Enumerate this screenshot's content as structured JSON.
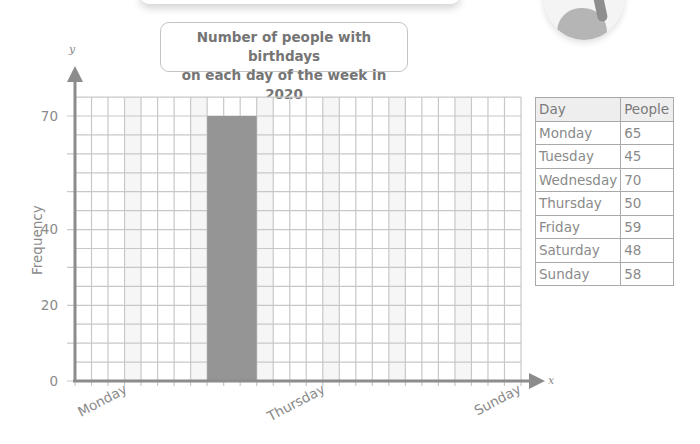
{
  "title": {
    "line1": "Number of people with birthdays",
    "line2": "on each day of the week in 2020"
  },
  "axes": {
    "y_letter": "y",
    "x_letter": "x",
    "ylabel": "Frequency",
    "y_ticks": [
      "0",
      "20",
      "40",
      "70"
    ],
    "x_labels": [
      "Monday",
      "Thursday",
      "Sunday"
    ]
  },
  "table": {
    "headers": [
      "Day",
      "People"
    ],
    "rows": [
      {
        "day": "Monday",
        "people": "65"
      },
      {
        "day": "Tuesday",
        "people": "45"
      },
      {
        "day": "Wednesday",
        "people": "70"
      },
      {
        "day": "Thursday",
        "people": "50"
      },
      {
        "day": "Friday",
        "people": "59"
      },
      {
        "day": "Saturday",
        "people": "48"
      },
      {
        "day": "Sunday",
        "people": "58"
      }
    ]
  },
  "colors": {
    "bar": "#959595",
    "grid": "#c8c8c8",
    "axis": "#8c8c8c"
  },
  "chart_data": {
    "type": "bar",
    "title": "Number of people with birthdays on each day of the week in 2020",
    "xlabel": "",
    "ylabel": "Frequency",
    "categories": [
      "Monday",
      "Tuesday",
      "Wednesday",
      "Thursday",
      "Friday",
      "Saturday",
      "Sunday"
    ],
    "values": [
      null,
      null,
      70,
      null,
      null,
      null,
      null
    ],
    "table_values": [
      65,
      45,
      70,
      50,
      59,
      48,
      58
    ],
    "y_tick_labels": [
      0,
      20,
      40,
      70
    ],
    "x_tick_labels_shown": [
      "Monday",
      "Thursday",
      "Sunday"
    ],
    "ylim": [
      0,
      75
    ],
    "grid": true,
    "legend": "none",
    "note": "Only the Wednesday bar (70) is drawn; other bars are to be completed from the table."
  }
}
